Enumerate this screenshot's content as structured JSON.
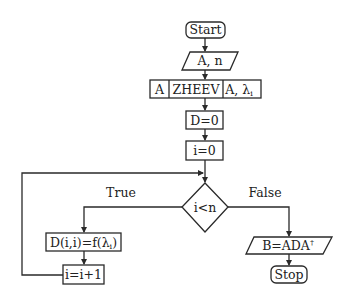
{
  "diagram": {
    "type": "flowchart",
    "nodes": {
      "start": {
        "label": "Start",
        "shape": "rounded-rect"
      },
      "input": {
        "label": "A, n",
        "shape": "parallelogram"
      },
      "zheev": {
        "shape": "predefined-process",
        "in": "A",
        "name": "ZHEEV",
        "out": "A, λ",
        "out_sub": "i"
      },
      "d_init": {
        "label": "D=0",
        "shape": "rect"
      },
      "i_init": {
        "label": "i=0",
        "shape": "rect"
      },
      "cond": {
        "label": "i<n",
        "shape": "diamond"
      },
      "assign": {
        "label_pre": "D(i,i)=f(λ",
        "label_sub": "i",
        "label_post": ")",
        "shape": "rect"
      },
      "incr": {
        "label": "i=i+1",
        "shape": "rect"
      },
      "output": {
        "label": "B=ADA",
        "label_sup": "†",
        "shape": "parallelogram"
      },
      "stop": {
        "label": "Stop",
        "shape": "rounded-rect"
      }
    },
    "edges": {
      "true_label": "True",
      "false_label": "False"
    }
  }
}
